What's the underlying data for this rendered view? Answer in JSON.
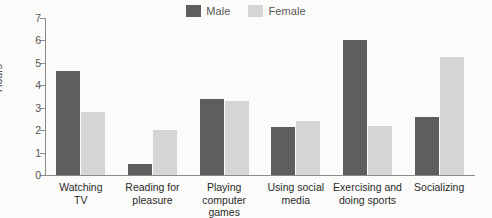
{
  "chart_data": {
    "type": "bar",
    "title": "",
    "xlabel": "",
    "ylabel": "Hours",
    "ylim": [
      0,
      7
    ],
    "yticks": [
      "7",
      "6",
      "5",
      "4",
      "3",
      "2",
      "1",
      "0"
    ],
    "grid": false,
    "legend_position": "top-center",
    "categories": [
      "Watching\nTV",
      "Reading for\npleasure",
      "Playing\ncomputer games",
      "Using social\nmedia",
      "Exercising and\ndoing sports",
      "Socializing"
    ],
    "series": [
      {
        "name": "Male",
        "color": "#5e5e5e",
        "values": [
          4.65,
          0.5,
          3.4,
          2.15,
          6.0,
          2.6
        ]
      },
      {
        "name": "Female",
        "color": "#d5d5d5",
        "values": [
          2.8,
          2.0,
          3.3,
          2.4,
          2.2,
          5.25
        ]
      }
    ]
  },
  "legend": {
    "entries": [
      {
        "label": "Male",
        "color": "#5e5e5e"
      },
      {
        "label": "Female",
        "color": "#d5d5d5"
      }
    ]
  },
  "axis": {
    "y_title": "Hours",
    "y_ticks": [
      "7",
      "6",
      "5",
      "4",
      "3",
      "2",
      "1",
      "0"
    ]
  }
}
